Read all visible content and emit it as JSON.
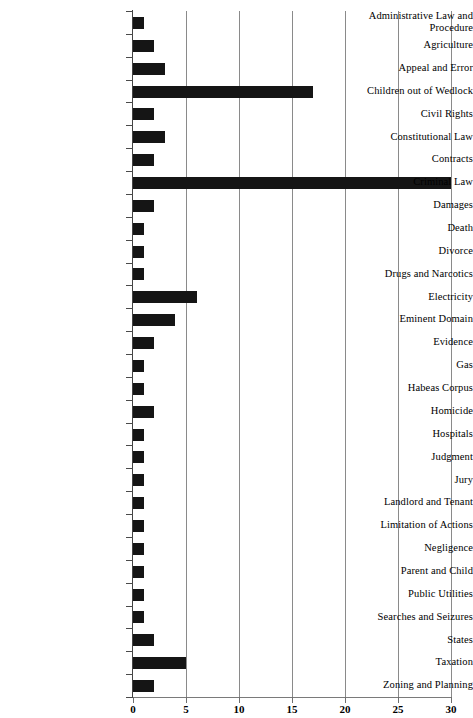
{
  "chart_data": {
    "type": "bar",
    "orientation": "horizontal",
    "title": "",
    "subtitle": "",
    "xlabel": "",
    "ylabel": "",
    "xlim": [
      0,
      30
    ],
    "ylim": null,
    "grid": "vertical-gridlines-at-x-ticks",
    "legend": "none",
    "bar_color": "#151515",
    "x_ticks": [
      0,
      5,
      10,
      15,
      20,
      25,
      30
    ],
    "x_tick_labels": [
      "0",
      "5",
      "10",
      "15",
      "20",
      "25",
      "30"
    ],
    "categories": [
      "Administrative Law and Procedure",
      "Agriculture",
      "Appeal and Error",
      "Children out of Wedlock",
      "Civil Rights",
      "Constitutional Law",
      "Contracts",
      "Criminal Law",
      "Damages",
      "Death",
      "Divorce",
      "Drugs and Narcotics",
      "Electricity",
      "Eminent Domain",
      "Evidence",
      "Gas",
      "Habeas Corpus",
      "Homicide",
      "Hospitals",
      "Judgment",
      "Jury",
      "Landlord and Tenant",
      "Limitation of Actions",
      "Negligence",
      "Parent and Child",
      "Public Utilities",
      "Searches and Seizures",
      "States",
      "Taxation",
      "Zoning and Planning"
    ],
    "values": [
      1,
      2,
      3,
      17,
      2,
      3,
      2,
      30,
      2,
      1,
      1,
      1,
      6,
      4,
      2,
      1,
      1,
      2,
      1,
      1,
      1,
      1,
      1,
      1,
      1,
      1,
      1,
      2,
      5,
      2
    ],
    "category_labels_wrapped": [
      [
        "Administrative Law and",
        "Procedure"
      ],
      [
        "Agriculture"
      ],
      [
        "Appeal and Error"
      ],
      [
        "Children out of Wedlock"
      ],
      [
        "Civil Rights"
      ],
      [
        "Constitutional Law"
      ],
      [
        "Contracts"
      ],
      [
        "Criminal Law"
      ],
      [
        "Damages"
      ],
      [
        "Death"
      ],
      [
        "Divorce"
      ],
      [
        "Drugs and Narcotics"
      ],
      [
        "Electricity"
      ],
      [
        "Eminent Domain"
      ],
      [
        "Evidence"
      ],
      [
        "Gas"
      ],
      [
        "Habeas Corpus"
      ],
      [
        "Homicide"
      ],
      [
        "Hospitals"
      ],
      [
        "Judgment"
      ],
      [
        "Jury"
      ],
      [
        "Landlord and Tenant"
      ],
      [
        "Limitation of Actions"
      ],
      [
        "Negligence"
      ],
      [
        "Parent and Child"
      ],
      [
        "Public Utilities"
      ],
      [
        "Searches and Seizures"
      ],
      [
        "States"
      ],
      [
        "Taxation"
      ],
      [
        "Zoning and Planning"
      ]
    ]
  }
}
